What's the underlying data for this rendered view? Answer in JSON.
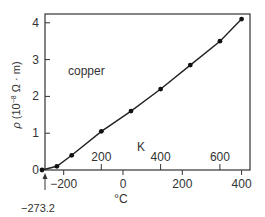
{
  "chart_data": {
    "type": "line",
    "title": "",
    "annotation": "copper",
    "xlabel": "°C",
    "x2label": "K",
    "ylabel": "ρ (10⁻⁸ Ω · m)",
    "ylabel_parts": {
      "rho": "ρ",
      "open": " (10",
      "exp": "−8",
      "rest": " Ω · m)"
    },
    "xlim": [
      -273.2,
      420
    ],
    "ylim": [
      0,
      4.3
    ],
    "xticks": [
      -200,
      0,
      200,
      400
    ],
    "xtick_labels": [
      "−200",
      "0",
      "200",
      "400"
    ],
    "x2ticks_kelvin": [
      200,
      400,
      600
    ],
    "x2tick_labels": [
      "200",
      "400",
      "600"
    ],
    "yticks": [
      0,
      1,
      2,
      3,
      4
    ],
    "ytick_labels": [
      "0",
      "1",
      "2",
      "3",
      "4"
    ],
    "special_marker": {
      "x": -273.2,
      "label": "−273.2"
    },
    "grid": false,
    "legend": null,
    "series": [
      {
        "name": "copper",
        "x": [
          -273.2,
          -223,
          -173,
          -73,
          27,
          127,
          227,
          327,
          400
        ],
        "values": [
          0.0,
          0.1,
          0.4,
          1.05,
          1.6,
          2.2,
          2.85,
          3.5,
          4.1
        ]
      }
    ]
  }
}
